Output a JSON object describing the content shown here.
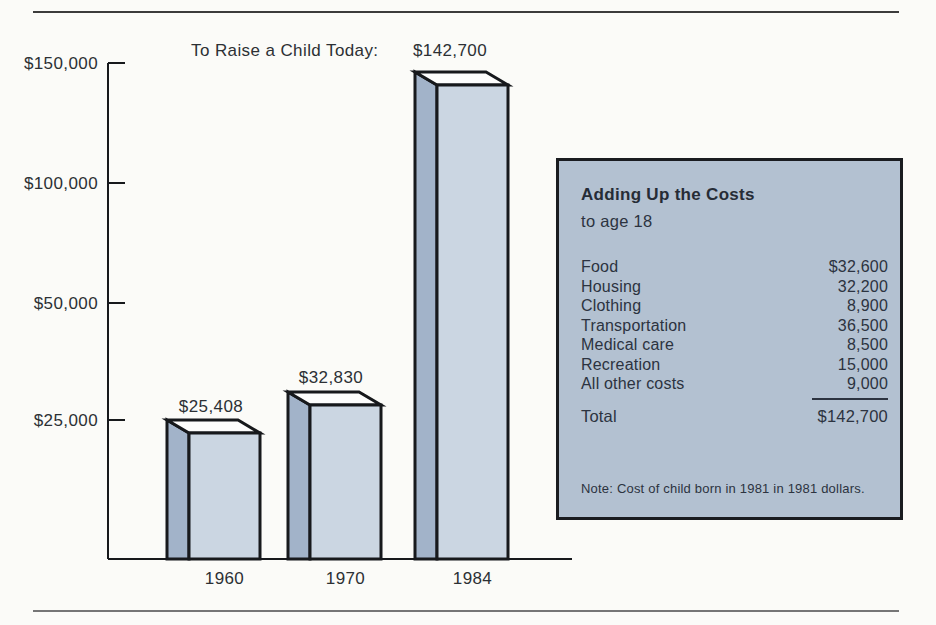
{
  "colors": {
    "panel_bg": "#b3c1d1",
    "bar_front": "#cbd6e2",
    "bar_side": "#a2b3c9",
    "bar_top": "#fdfdfc",
    "outline": "#17191c",
    "text": "#2c3034"
  },
  "chart_data": {
    "type": "bar",
    "title": "To Raise a Child Today:",
    "categories": [
      "1960",
      "1970",
      "1984"
    ],
    "values": [
      25408,
      32830,
      142700
    ],
    "value_labels": [
      "$25,408",
      "$32,830",
      "$142,700"
    ],
    "y_ticks": [
      {
        "label": "$25,000",
        "value": 25000
      },
      {
        "label": "$50,000",
        "value": 50000
      },
      {
        "label": "$100,000",
        "value": 100000
      },
      {
        "label": "$150,000",
        "value": 150000
      }
    ],
    "ylim": [
      0,
      150000
    ],
    "xlabel": "",
    "ylabel": "",
    "grid": false,
    "legend": "none",
    "bar_style": "3d-box",
    "breakdown": {
      "Food": 32600,
      "Housing": 32200,
      "Clothing": 8900,
      "Transportation": 36500,
      "Medical care": 8500,
      "Recreation": 15000,
      "All other costs": 9000,
      "Total": 142700
    }
  },
  "panel": {
    "title": "Adding Up the Costs",
    "subtitle": "to age 18",
    "rows": [
      {
        "label": "Food",
        "value": "$32,600"
      },
      {
        "label": "Housing",
        "value": "32,200"
      },
      {
        "label": "Clothing",
        "value": "8,900"
      },
      {
        "label": "Transportation",
        "value": "36,500"
      },
      {
        "label": "Medical care",
        "value": "8,500"
      },
      {
        "label": "Recreation",
        "value": "15,000"
      },
      {
        "label": "All other costs",
        "value": "9,000"
      }
    ],
    "total_label": "Total",
    "total_value": "$142,700",
    "note": "Note: Cost of child born in 1981 in 1981 dollars."
  }
}
